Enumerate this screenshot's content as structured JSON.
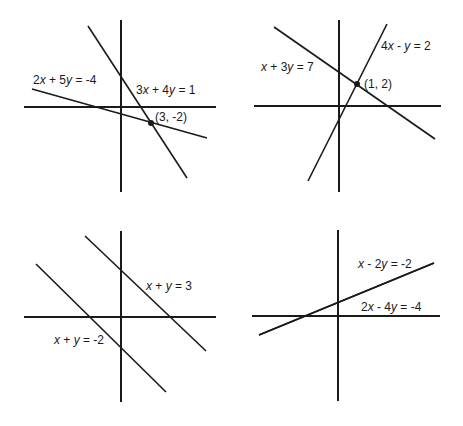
{
  "chart_data": [
    {
      "type": "line",
      "title": "",
      "panel": "top-left",
      "description": "Intersecting lines with a single solution",
      "series": [
        {
          "name": "3x + 4y = 1",
          "x1": 88,
          "y1": 26,
          "x2": 187,
          "y2": 178
        },
        {
          "name": "2x + 5y = -4",
          "x1": 32,
          "y1": 89,
          "x2": 207,
          "y2": 138
        }
      ],
      "axes": {
        "vx": 121,
        "vy1": 20,
        "vy2": 192,
        "hy": 107,
        "hx1": 24,
        "hx2": 216
      },
      "intersection": {
        "label": "(3, -2)",
        "x": 151,
        "y": 123
      },
      "labels": [
        {
          "text": "2x + 5y = -4",
          "x": 33,
          "y": 84
        },
        {
          "text": "3x + 4y = 1",
          "x": 136,
          "y": 94
        },
        {
          "text": "(3, -2)",
          "x": 155,
          "y": 121
        }
      ]
    },
    {
      "type": "line",
      "title": "",
      "panel": "top-right",
      "description": "Intersecting lines with a single solution",
      "series": [
        {
          "name": "x + 3y = 7",
          "x1": 274,
          "y1": 27,
          "x2": 435,
          "y2": 139
        },
        {
          "name": "4x - y = 2",
          "x1": 308,
          "y1": 181,
          "x2": 387,
          "y2": 24
        }
      ],
      "axes": {
        "vx": 339,
        "vy1": 20,
        "vy2": 192,
        "hy": 106,
        "hx1": 254,
        "hx2": 441
      },
      "intersection": {
        "label": "(1, 2)",
        "x": 357,
        "y": 84
      },
      "labels": [
        {
          "text": "x + 3y = 7",
          "x": 261,
          "y": 71
        },
        {
          "text": "4x - y = 2",
          "x": 381,
          "y": 50
        },
        {
          "text": "(1, 2)",
          "x": 364,
          "y": 88
        }
      ]
    },
    {
      "type": "line",
      "title": "",
      "panel": "bottom-left",
      "description": "Parallel lines, no solution",
      "series": [
        {
          "name": "x + y = 3",
          "x1": 85,
          "y1": 236,
          "x2": 206,
          "y2": 351
        },
        {
          "name": "x + y = -2",
          "x1": 36,
          "y1": 264,
          "x2": 166,
          "y2": 392
        }
      ],
      "axes": {
        "vx": 121,
        "vy1": 231,
        "vy2": 402,
        "hy": 317,
        "hx1": 24,
        "hx2": 216
      },
      "intersection": null,
      "labels": [
        {
          "text": "x + y = 3",
          "x": 146,
          "y": 290
        },
        {
          "text": "x + y = -2",
          "x": 54,
          "y": 344
        }
      ]
    },
    {
      "type": "line",
      "title": "",
      "panel": "bottom-right",
      "description": "Coincident lines, infinitely many solutions",
      "series": [
        {
          "name": "x - 2y = -2",
          "x1": 259,
          "y1": 335,
          "x2": 434,
          "y2": 263
        },
        {
          "name": "2x - 4y = -4",
          "x1": 259,
          "y1": 335,
          "x2": 434,
          "y2": 263
        }
      ],
      "axes": {
        "vx": 338,
        "vy1": 230,
        "vy2": 401,
        "hy": 316,
        "hx1": 252,
        "hx2": 440
      },
      "intersection": null,
      "labels": [
        {
          "text": "x - 2y = -2",
          "x": 358,
          "y": 268
        },
        {
          "text": "2x - 4y = -4",
          "x": 361,
          "y": 311
        }
      ]
    }
  ]
}
